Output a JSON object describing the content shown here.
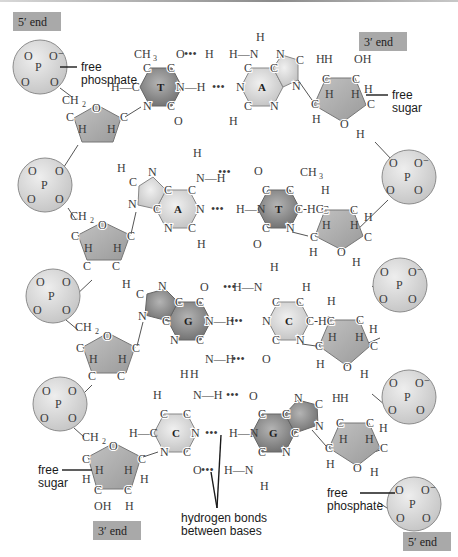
{
  "figure": {
    "colors": {
      "end_label_bg": "#a9a9a9",
      "phosphate_fill": "#d9d9d9",
      "sugar_fill": "#a8a8a8",
      "purine_fill_light": "#cfcfcf",
      "pyrimidine_fill_light": "#dcdcdc",
      "dark_base_fill": "#8c8c8c",
      "bond_color": "#555555"
    }
  },
  "end_labels": {
    "top_left": "5′ end",
    "top_right": "3′ end",
    "bottom_left": "3′ end",
    "bottom_right": "5′ end"
  },
  "callouts": {
    "free_phosphate_top": "free\nphosphate",
    "free_phosphate_top_line1": "free",
    "free_phosphate_top_line2": "phosphate",
    "free_sugar_top_line1": "free",
    "free_sugar_top_line2": "sugar",
    "free_sugar_bottom_line1": "free",
    "free_sugar_bottom_line2": "sugar",
    "free_phosphate_bottom_line1": "free",
    "free_phosphate_bottom_line2": "phosphate",
    "hydrogen_bonds_line1": "hydrogen bonds",
    "hydrogen_bonds_line2": "between bases"
  },
  "base_pairs": [
    {
      "left": "T",
      "right": "A",
      "left_dark": true,
      "right_dark": false
    },
    {
      "left": "A",
      "right": "T",
      "left_dark": false,
      "right_dark": true
    },
    {
      "left": "G",
      "right": "C",
      "left_dark": true,
      "right_dark": false
    },
    {
      "left": "C",
      "right": "G",
      "left_dark": false,
      "right_dark": true
    }
  ],
  "atoms": {
    "P": "P",
    "O": "O",
    "Ominus": "O⁻",
    "C": "C",
    "N": "N",
    "H": "H",
    "CH2": "CH",
    "CH3": "CH",
    "H2C": "H",
    "OH": "OH",
    "sub2": "2",
    "sub3": "3",
    "NH": "N—H",
    "HN": "H—N",
    "HC": "H—C",
    "CH": "C-H",
    "CHH": "C-HC",
    "hbond_dots": "•••"
  }
}
